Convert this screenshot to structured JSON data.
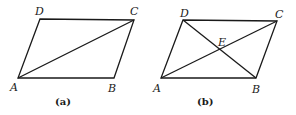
{
  "figures": [
    {
      "caption": "(a)",
      "vertices": {
        "A": "A",
        "B": "B",
        "C": "C",
        "D": "D"
      },
      "shape": "parallelogram ABCD",
      "diagonals": [
        "AC"
      ]
    },
    {
      "caption": "(b)",
      "vertices": {
        "A": "A",
        "B": "B",
        "C": "C",
        "D": "D",
        "E": "E"
      },
      "shape": "parallelogram ABCD",
      "diagonals": [
        "AC",
        "BD"
      ],
      "intersection": "E"
    }
  ]
}
